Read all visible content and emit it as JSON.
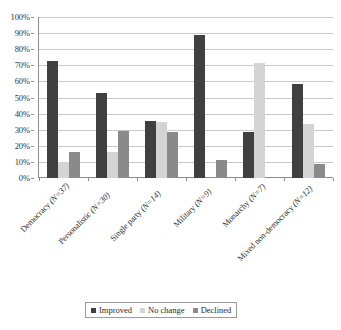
{
  "chart_data": {
    "type": "bar",
    "title": "",
    "subtitle": "",
    "xlabel": "",
    "ylabel": "",
    "ylim": [
      0,
      100
    ],
    "y_ticks": [
      "0%",
      "10%",
      "20%",
      "30%",
      "40%",
      "50%",
      "60%",
      "70%",
      "80%",
      "90%",
      "100%"
    ],
    "grid": true,
    "legend_position": "bottom",
    "categories": [
      "Democracy (N=37)",
      "Personalistic (N=30)",
      "Single party (N=14)",
      "Military (N=9)",
      "Monarchy (N=7)",
      "Mixed non-democracy (N=12)"
    ],
    "category_parts": [
      {
        "name": "Democracy ",
        "n": "(N=37)"
      },
      {
        "name": "Personalistic ",
        "n": "(N=30)"
      },
      {
        "name": "Single party ",
        "n": "(N=14)"
      },
      {
        "name": "Military ",
        "n": "(N=9)"
      },
      {
        "name": "Monarchy ",
        "n": "(N=7)"
      },
      {
        "name": "Mixed non-democracy ",
        "n": "(N=12)"
      }
    ],
    "series": [
      {
        "name": "Improved",
        "color": "#404040",
        "values": [
          72.5,
          53.0,
          35.7,
          88.9,
          28.6,
          58.3
        ]
      },
      {
        "name": "No change",
        "color": "#d4d4d4",
        "values": [
          10.0,
          16.0,
          35.0,
          0.0,
          71.4,
          33.3
        ]
      },
      {
        "name": "Declined",
        "color": "#8a8a8a",
        "values": [
          16.0,
          29.5,
          28.3,
          11.1,
          0.0,
          8.4
        ]
      }
    ]
  },
  "legend": {
    "items": [
      {
        "label": "Improved",
        "swatch": "legend-swatch-improved"
      },
      {
        "label": "No change",
        "swatch": "legend-swatch-nochange"
      },
      {
        "label": "Declined",
        "swatch": "legend-swatch-declined"
      }
    ]
  },
  "colors": {
    "improved": "#404040",
    "no_change": "#d4d4d4",
    "declined": "#8a8a8a",
    "gridline": "#c8c8c8",
    "axis": "#8d8d8d",
    "background": "#ffffff"
  }
}
